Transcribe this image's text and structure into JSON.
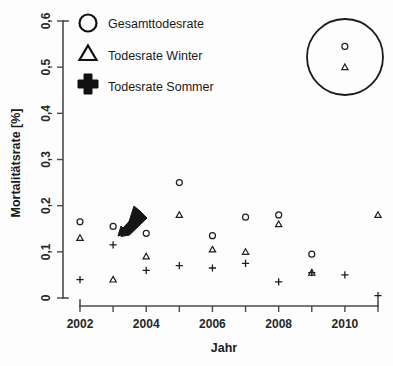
{
  "chart_data": {
    "type": "scatter",
    "title": "",
    "xlabel": "Jahr",
    "ylabel": "Mortalitätsrate [%]",
    "xlim": [
      2001.4,
      2011.6
    ],
    "ylim": [
      0,
      0.62
    ],
    "grid": false,
    "legend_position": "top-left",
    "x_tick_labels": [
      "2002",
      "2004",
      "2006",
      "2008",
      "2010"
    ],
    "x_tick_values": [
      2002,
      2004,
      2006,
      2008,
      2010
    ],
    "x_minor_ticks": [
      2003,
      2005,
      2007,
      2009,
      2011
    ],
    "y_tick_labels": [
      "0",
      "0,1",
      "0,2",
      "0,3",
      "0,4",
      "0,5",
      "0,6"
    ],
    "y_tick_values": [
      0,
      0.1,
      0.2,
      0.3,
      0.4,
      0.5,
      0.6
    ],
    "x": [
      2002,
      2003,
      2004,
      2005,
      2006,
      2007,
      2008,
      2009,
      2010,
      2011
    ],
    "series": [
      {
        "name": "Gesamttodesrate",
        "marker": "circle",
        "values": [
          0.165,
          0.155,
          0.14,
          0.25,
          0.135,
          0.175,
          0.18,
          0.095,
          0.545,
          null
        ]
      },
      {
        "name": "Todesrate Winter",
        "marker": "triangle",
        "values": [
          0.13,
          0.04,
          0.09,
          0.18,
          0.105,
          0.1,
          0.16,
          0.055,
          0.5,
          0.18
        ]
      },
      {
        "name": "Todesrate Sommer",
        "marker": "plus",
        "values": [
          0.04,
          0.115,
          0.06,
          0.07,
          0.065,
          0.075,
          0.035,
          0.055,
          0.05,
          0.005
        ]
      }
    ],
    "annotations": [
      {
        "name": "highlight-circle",
        "shape": "circle",
        "center_x": 2010,
        "center_y": 0.522,
        "radius_px": 38,
        "note": "ring highlighting the 2010 Gesamttodesrate and Todesrate Winter points"
      },
      {
        "name": "arrow",
        "shape": "arrow",
        "points_to_x": 2003,
        "points_to_y": 0.115,
        "direction": "down-left",
        "note": "thick black arrow pointing at the 2003 Todesrate Sommer point"
      }
    ]
  },
  "legend": {
    "items": [
      {
        "label": "Gesamttodesrate",
        "marker": "circle"
      },
      {
        "label": "Todesrate Winter",
        "marker": "triangle"
      },
      {
        "label": "Todesrate Sommer",
        "marker": "plus"
      }
    ]
  },
  "axes": {
    "x_title": "Jahr",
    "y_title": "Mortalitätsrate [%]"
  }
}
